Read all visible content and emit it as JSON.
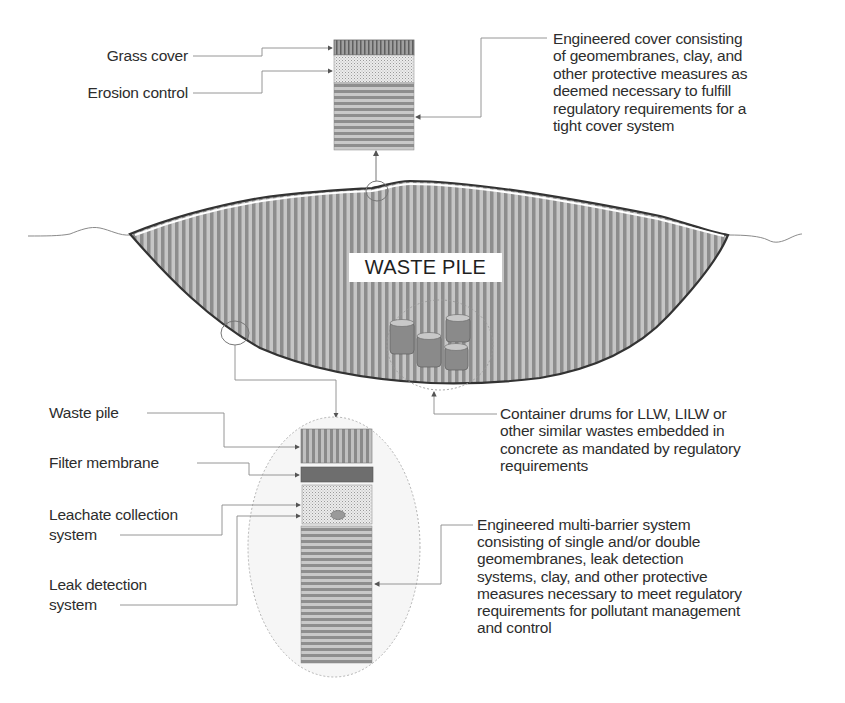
{
  "diagram": {
    "main_label": "WASTE PILE",
    "cover_detail": {
      "layers": [
        {
          "label": "Grass cover"
        },
        {
          "label": "Erosion control"
        }
      ],
      "description": "Engineered cover consisting\nof geomembranes, clay, and\nother protective measures as\ndeemed necessary to fulfill\nregulatory requirements for a\ntight cover system"
    },
    "drums": {
      "description": "Container drums for LLW, LILW or\nother similar wastes embedded in\nconcrete as mandated by regulatory\nrequirements"
    },
    "liner_detail": {
      "layers": [
        {
          "label": "Waste pile"
        },
        {
          "label": "Filter membrane"
        },
        {
          "label": "Leachate collection\nsystem"
        },
        {
          "label": "Leak detection\nsystem"
        }
      ],
      "description": "Engineered multi-barrier system\nconsisting of single and/or double\ngeomembranes, leak detection\nsystems, clay, and other protective\nmeasures necessary to meet regulatory\nrequirements for pollutant management\nand control"
    },
    "colors": {
      "fill_stripe_dark": "#8f8f8f",
      "fill_stripe_light": "#c4c4c4",
      "outline": "#333333",
      "filter_membrane": "#6e6e6e",
      "drum": "#8a8a8a",
      "connector": "#7a7a7a"
    }
  }
}
